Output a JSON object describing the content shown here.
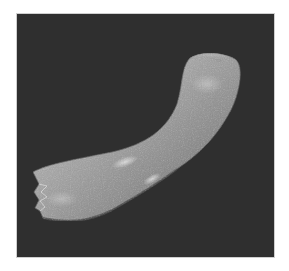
{
  "image": {
    "description": "Scanning electron micrograph of a curved, elongated specimen on a dark background",
    "subject": "curved elongated specimen",
    "background_color": "#2f2f2f",
    "subject_color": "#9a9a9a",
    "highlight_color": "#d8d8d8",
    "border_color": "#ffffff"
  }
}
